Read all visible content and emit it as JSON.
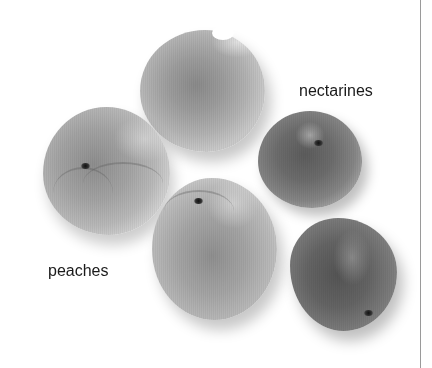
{
  "illustration": {
    "subject": "peaches and nectarines",
    "labels": {
      "nectarines": "nectarines",
      "peaches": "peaches"
    },
    "fruits": [
      {
        "kind": "peach",
        "position": "top-center"
      },
      {
        "kind": "peach",
        "position": "left"
      },
      {
        "kind": "peach",
        "position": "bottom-center"
      },
      {
        "kind": "nectarine",
        "position": "right-upper"
      },
      {
        "kind": "nectarine",
        "position": "right-lower"
      }
    ],
    "colors": {
      "background": "#ffffff",
      "peach_skin": "#a4a4a4",
      "nectarine_skin": "#6c6c6c",
      "label_text": "#1a1a1a",
      "rule": "#9a9a9a"
    }
  }
}
